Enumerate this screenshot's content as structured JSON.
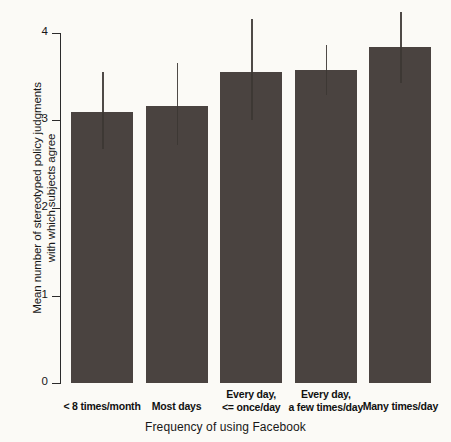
{
  "chart_data": {
    "type": "bar",
    "title": "",
    "xlabel": "Frequency of using Facebook",
    "ylabel_line1": "Mean number of stereotyped policy judgments",
    "ylabel_line2": "with which subjects agree",
    "categories": [
      "< 8 times/month",
      "Most days",
      "Every day, <= once/day",
      "Every day, a few times/day",
      "Many times/day"
    ],
    "category_lines": [
      [
        "",
        "< 8 times/month"
      ],
      [
        "",
        "Most days"
      ],
      [
        "Every day,",
        "<= once/day"
      ],
      [
        "Every day,",
        "a few times/day"
      ],
      [
        "",
        "Many times/day"
      ]
    ],
    "values": [
      3.1,
      3.17,
      3.56,
      3.58,
      3.84
    ],
    "error_upper": [
      3.56,
      3.66,
      4.16,
      3.87,
      4.24
    ],
    "error_lower": [
      2.68,
      2.72,
      3.01,
      3.3,
      3.43
    ],
    "ylim": [
      0,
      4.25
    ],
    "yticks": [
      0,
      1,
      2,
      3,
      4
    ],
    "ytick_labels": [
      "0",
      "1",
      "2",
      "3",
      "4"
    ],
    "grid": false,
    "legend": "none",
    "bar_color": "#4a4340",
    "error_color": "#4f4a47",
    "axis_color": "#2b2b2b",
    "background": "#fbfaf6"
  }
}
